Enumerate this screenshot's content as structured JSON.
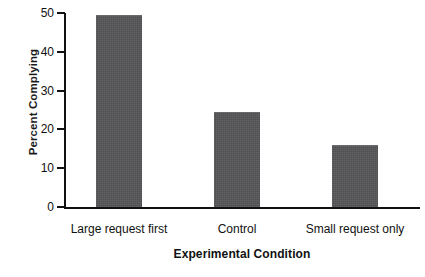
{
  "chart_data": {
    "type": "bar",
    "title": "",
    "xlabel": "Experimental Condition",
    "ylabel": "Percent Complying",
    "categories": [
      "Large request first",
      "Control",
      "Small request only"
    ],
    "values": [
      49.5,
      24.5,
      16
    ],
    "ylim": [
      0,
      50
    ],
    "yticks": [
      0,
      10,
      20,
      30,
      40,
      50
    ],
    "ytick_labels": [
      "0",
      "10",
      "20",
      "30",
      "40",
      "50"
    ],
    "grid": false,
    "legend": null,
    "bar_color": "#565658",
    "axis_color": "#111111",
    "background_color": "#ffffff"
  }
}
